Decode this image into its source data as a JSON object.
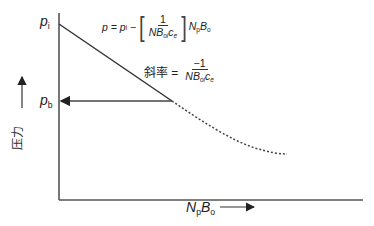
{
  "diagram": {
    "y_axis_label": "压力",
    "x_axis_label": {
      "main": "N",
      "sub1": "p",
      "main2": "B",
      "sub2": "o"
    },
    "pi_label": {
      "main": "p",
      "sub": "i"
    },
    "pb_label": {
      "main": "p",
      "sub": "b"
    },
    "equation": {
      "lhs": "p = p",
      "lhs_sub": "i",
      "minus": " − ",
      "frac_num": "1",
      "frac_den_main": "NB",
      "frac_den_sub1": "oi",
      "frac_den_c": "c",
      "frac_den_sub2": "e",
      "tail_main": "N",
      "tail_sub1": "p",
      "tail_main2": "B",
      "tail_sub2": "o"
    },
    "slope": {
      "label": "斜率 =",
      "num": "−1",
      "den_main": "NB",
      "den_sub1": "oi",
      "den_c": "c",
      "den_sub2": "e"
    },
    "colors": {
      "axis": "#555555",
      "line": "#333333",
      "dotted": "#444444"
    }
  }
}
